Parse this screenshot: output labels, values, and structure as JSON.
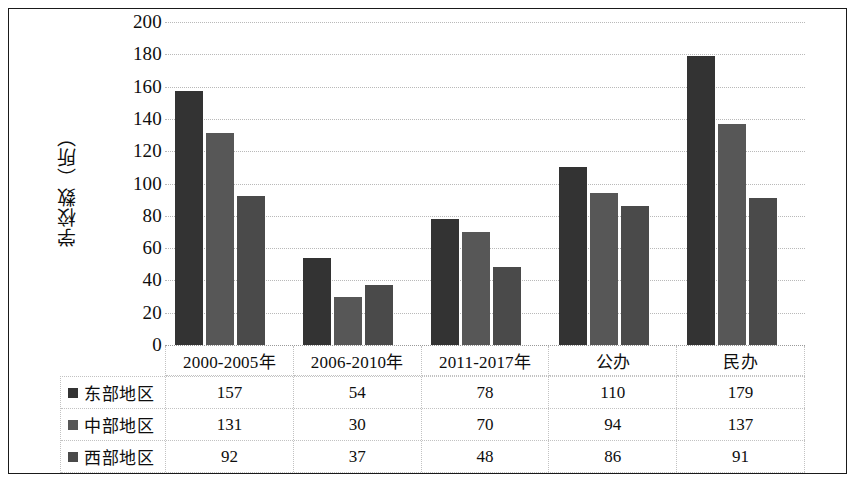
{
  "chart_data": {
    "type": "bar",
    "title": "",
    "xlabel": "",
    "ylabel": "学校数（所）",
    "ylim": [
      0,
      200
    ],
    "yticks": [
      200,
      180,
      160,
      140,
      120,
      100,
      80,
      60,
      40,
      20,
      0
    ],
    "grid": true,
    "legend_position": "data-table",
    "categories": [
      "2000-2005年",
      "2006-2010年",
      "2011-2017年",
      "公办",
      "民办"
    ],
    "series": [
      {
        "name": "东部地区",
        "color": "#333333",
        "values": [
          157,
          54,
          78,
          110,
          179
        ]
      },
      {
        "name": "中部地区",
        "color": "#575757",
        "values": [
          131,
          30,
          70,
          94,
          137
        ]
      },
      {
        "name": "西部地区",
        "color": "#4a4a4a",
        "values": [
          92,
          37,
          48,
          86,
          91
        ]
      }
    ]
  }
}
